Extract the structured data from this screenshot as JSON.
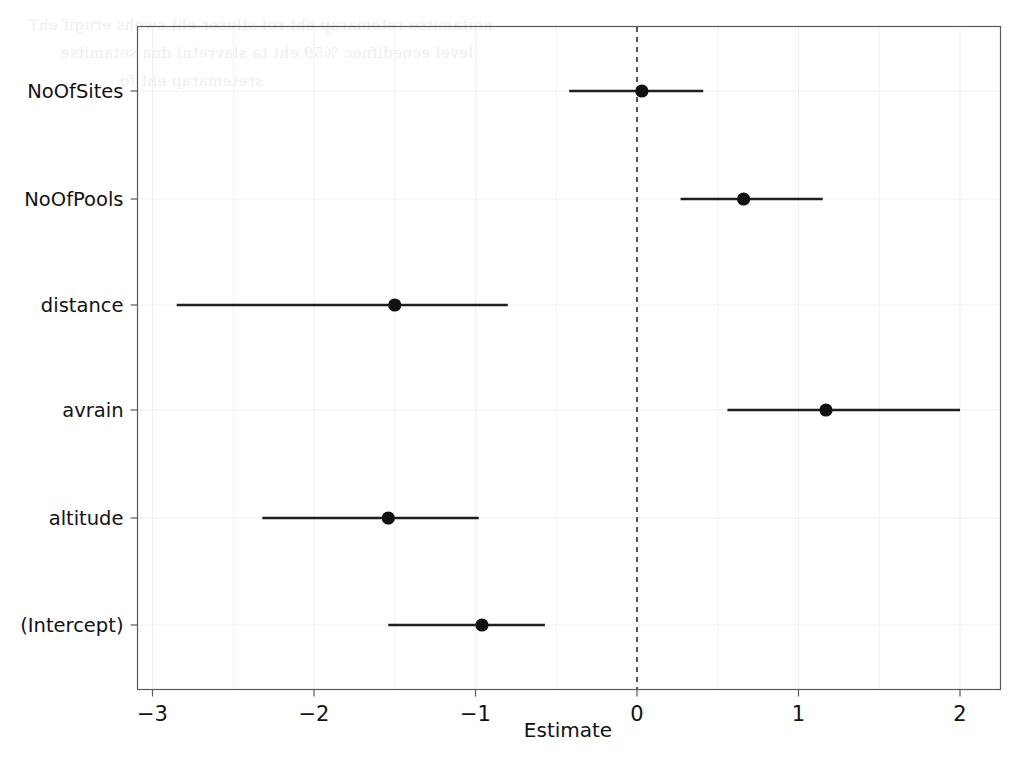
{
  "chart_data": {
    "type": "scatter",
    "subtype": "coefficient-forest-plot",
    "title": "",
    "xlabel": "Estimate",
    "ylabel": "",
    "xlim": [
      -3.3,
      2.25
    ],
    "ylim": [
      -0.5,
      5.5
    ],
    "grid": true,
    "grid_style": "faint light-grey vertical gridlines at major and minor x ticks, horizontal gridlines at each term row",
    "legend": "none",
    "orientation": "horizontal",
    "reference_line": {
      "value": 0,
      "orientation": "vertical",
      "style": "dashed",
      "color": "#3a3a3a"
    },
    "xticks": [
      -3,
      -2,
      -1,
      0,
      1,
      2
    ],
    "xticklabels": [
      "-3",
      "-2",
      "-1",
      "0",
      "1",
      "2"
    ],
    "categories": [
      "(Intercept)",
      "altitude",
      "avrain",
      "distance",
      "NoOfPools",
      "NoOfSites"
    ],
    "point_color": "#111111",
    "errorbar_color": "#1f1f1f",
    "points": [
      {
        "term": "NoOfSites",
        "estimate": 0.03,
        "ci_low": -0.42,
        "ci_high": 0.41
      },
      {
        "term": "NoOfPools",
        "estimate": 0.66,
        "ci_low": 0.27,
        "ci_high": 1.15
      },
      {
        "term": "distance",
        "estimate": -1.5,
        "ci_low": -2.85,
        "ci_high": -0.8
      },
      {
        "term": "avrain",
        "estimate": 1.17,
        "ci_low": 0.56,
        "ci_high": 2.0
      },
      {
        "term": "altitude",
        "estimate": -1.54,
        "ci_low": -2.32,
        "ci_high": -0.98
      },
      {
        "term": "(Intercept)",
        "estimate": -0.96,
        "ci_low": -1.54,
        "ci_high": -0.57
      }
    ]
  },
  "axes": {
    "x_title": "Estimate",
    "x_tick_labels": [
      "-3",
      "-2",
      "-1",
      "0",
      "1",
      "2"
    ],
    "y_tick_labels": [
      "NoOfSites",
      "NoOfPools",
      "distance",
      "avrain",
      "altitude",
      "(Intercept)"
    ]
  },
  "scan_ghost": {
    "lines": [
      "noitamitse retemarap eht rof stluser eht swohs erugif ehT",
      "level ecnedifnoc %59 eht ta slavretni dna setamitse",
      "sretemarap eht fo"
    ]
  },
  "colors": {
    "background": "#ffffff",
    "frame": "#595959",
    "gridline": "#f0f0f0",
    "point": "#111111",
    "errorbar": "#1f1f1f",
    "reference": "#3a3a3a",
    "text": "#121212"
  }
}
